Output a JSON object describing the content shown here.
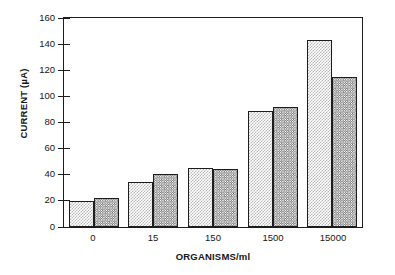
{
  "chart_data": {
    "type": "bar",
    "title": "",
    "xlabel": "ORGANISMS/ml",
    "ylabel": "CURRENT (µA)",
    "categories": [
      "0",
      "15",
      "150",
      "1500",
      "15000"
    ],
    "series": [
      {
        "name": "light",
        "values": [
          20,
          34,
          45,
          88,
          142
        ]
      },
      {
        "name": "dark",
        "values": [
          22,
          40,
          44,
          91,
          114
        ]
      }
    ],
    "ylim": [
      0,
      160
    ],
    "yticks": [
      0,
      20,
      40,
      60,
      80,
      100,
      120,
      140,
      160
    ],
    "ytick_labels": [
      "0",
      "20",
      "40",
      "60",
      "80",
      "100",
      "120",
      "140",
      "160"
    ],
    "grid": false,
    "legend": "none",
    "frame": true,
    "tick_side": "both"
  }
}
